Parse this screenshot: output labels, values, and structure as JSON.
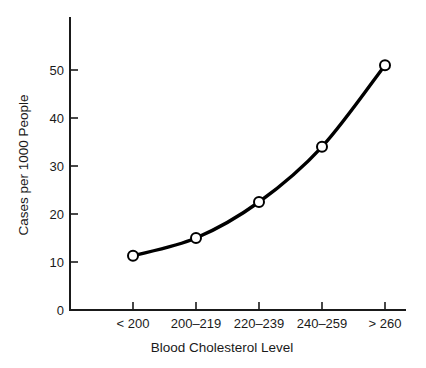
{
  "chart_data": {
    "type": "line",
    "title": "",
    "subtitle": "",
    "xlabel": "Blood Cholesterol Level",
    "ylabel": "Cases per 1000 People",
    "categories": [
      "<200",
      "200-219",
      "220-239",
      "240-259",
      ">260"
    ],
    "category_labels_display": [
      "< 200",
      "200–219",
      "220–239",
      "240–259",
      "> 260"
    ],
    "values": [
      11.3,
      15.0,
      22.5,
      34.0,
      51.0
    ],
    "series": [
      {
        "name": "Cases per 1000 People",
        "values": [
          11.3,
          15.0,
          22.5,
          34.0,
          51.0
        ]
      }
    ],
    "ylim": [
      0,
      57
    ],
    "yticks": [
      0,
      10,
      20,
      30,
      40,
      50
    ],
    "ytick_labels": [
      "0",
      "10",
      "20",
      "30",
      "40",
      "50"
    ],
    "grid": false,
    "legend": false,
    "legend_position": "none",
    "marker": "open-circle",
    "line_color": "#000000",
    "marker_fill": "#ffffff",
    "marker_edge_color": "#000000",
    "background_color": "#ffffff",
    "annotations": []
  },
  "axes": {
    "y_tick_0": "0",
    "y_tick_10": "10",
    "y_tick_20": "20",
    "y_tick_30": "30",
    "y_tick_40": "40",
    "y_tick_50": "50",
    "x_tick_1": "< 200",
    "x_tick_2": "200–219",
    "x_tick_3": "220–239",
    "x_tick_4": "240–259",
    "x_tick_5": "> 260",
    "x_title": "Blood Cholesterol Level",
    "y_title": "Cases per 1000 People"
  }
}
